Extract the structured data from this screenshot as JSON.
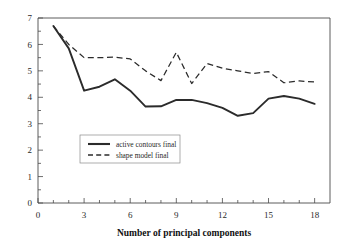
{
  "chart_data": {
    "type": "line",
    "title": "",
    "subtitle": "",
    "xlabel": "Number of principal components",
    "ylabel": "",
    "xlim": [
      0,
      19
    ],
    "ylim": [
      0,
      7
    ],
    "grid": false,
    "legend_position": "center-left-inside",
    "x": [
      1,
      2,
      3,
      4,
      5,
      6,
      7,
      8,
      9,
      10,
      11,
      12,
      13,
      14,
      15,
      16,
      17,
      18
    ],
    "xticks": [
      0,
      3,
      6,
      9,
      12,
      15,
      18
    ],
    "xtick_labels": [
      "0",
      "3",
      "6",
      "9",
      "12",
      "15",
      "18"
    ],
    "x_minor_ticks": [
      1,
      2,
      4,
      5,
      7,
      8,
      10,
      11,
      13,
      14,
      16,
      17
    ],
    "yticks": [
      0,
      1,
      2,
      3,
      4,
      5,
      6,
      7
    ],
    "ytick_labels": [
      "0",
      "1",
      "2",
      "3",
      "4",
      "5",
      "6",
      "7"
    ],
    "y_minor_ticks": [
      0.5,
      1.5,
      2.5,
      3.5,
      4.5,
      5.5,
      6.5
    ],
    "series": [
      {
        "name": "active contours final",
        "style": "solid",
        "color": "#2b2b2b",
        "values": [
          6.7,
          5.85,
          4.25,
          4.4,
          4.68,
          4.25,
          3.65,
          3.66,
          3.9,
          3.9,
          3.78,
          3.6,
          3.3,
          3.4,
          3.95,
          4.05,
          3.95,
          3.75
        ]
      },
      {
        "name": "shape model final",
        "style": "dashed",
        "color": "#2b2b2b",
        "values": [
          6.7,
          6.0,
          5.5,
          5.5,
          5.52,
          5.45,
          5.0,
          4.63,
          5.7,
          4.52,
          5.28,
          5.1,
          5.0,
          4.9,
          4.97,
          4.55,
          4.62,
          4.58
        ]
      }
    ],
    "legend_entries": [
      "active contours final",
      "shape model final"
    ]
  }
}
